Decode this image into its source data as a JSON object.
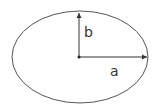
{
  "diagram": {
    "shape": "ellipse",
    "labels": {
      "semi_minor": "b",
      "semi_major": "a"
    },
    "colors": {
      "stroke": "#555555",
      "text": "#333333",
      "background": "#ffffff"
    }
  }
}
